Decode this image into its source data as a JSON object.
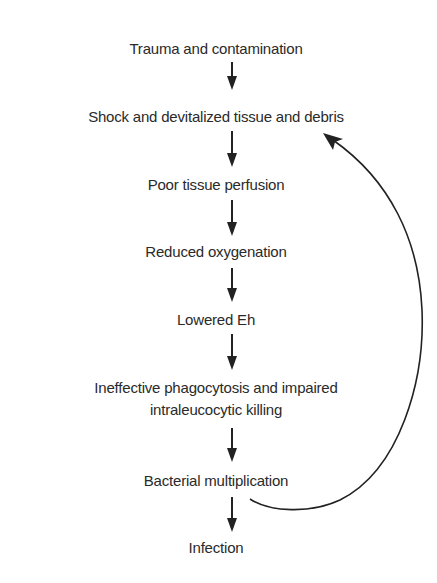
{
  "diagram": {
    "type": "flowchart",
    "direction": "top-to-bottom",
    "nodes": [
      {
        "id": "n1",
        "label": "Trauma and contamination"
      },
      {
        "id": "n2",
        "label": "Shock and devitalized tissue and debris"
      },
      {
        "id": "n3",
        "label": "Poor tissue perfusion"
      },
      {
        "id": "n4",
        "label": "Reduced oxygenation"
      },
      {
        "id": "n5",
        "label": "Lowered Eh"
      },
      {
        "id": "n6",
        "label_line1": "Ineffective phagocytosis and impaired",
        "label_line2": "intraleucocytic killing"
      },
      {
        "id": "n7",
        "label": "Bacterial multiplication"
      },
      {
        "id": "n8",
        "label": "Infection"
      }
    ],
    "edges": [
      {
        "from": "n1",
        "to": "n2"
      },
      {
        "from": "n2",
        "to": "n3"
      },
      {
        "from": "n3",
        "to": "n4"
      },
      {
        "from": "n4",
        "to": "n5"
      },
      {
        "from": "n5",
        "to": "n6"
      },
      {
        "from": "n6",
        "to": "n7"
      },
      {
        "from": "n7",
        "to": "n8"
      },
      {
        "from": "n7",
        "to": "n2",
        "style": "curved-feedback"
      }
    ],
    "colors": {
      "text": "#2a2a2a",
      "arrow": "#222222",
      "background": "#ffffff"
    }
  }
}
